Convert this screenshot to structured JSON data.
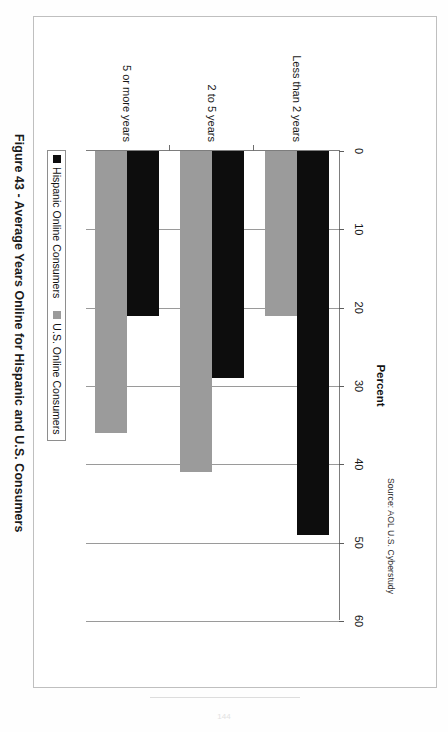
{
  "document": {
    "caption": "Figure 43 - Average Years Online for Hispanic and U.S. Consumers",
    "page_number": "144"
  },
  "chart_data": {
    "type": "bar",
    "orientation": "horizontal",
    "title": "",
    "xlabel": "Percent",
    "ylabel": "",
    "xlim": [
      0,
      60
    ],
    "xticks": [
      0,
      10,
      20,
      30,
      40,
      50,
      60
    ],
    "xtick_labels": [
      "0",
      "10",
      "20",
      "30",
      "40",
      "50",
      "60"
    ],
    "grid": true,
    "grid_axis": "x",
    "legend_position": "bottom-left",
    "categories": [
      "Less than 2 years",
      "2 to 5 years",
      "5 or more years"
    ],
    "series": [
      {
        "name": "Hispanic Online Consumers",
        "color": "#0d0d0d",
        "values": [
          49,
          29,
          21
        ]
      },
      {
        "name": "U.S. Online Consumers",
        "color": "#9b9b9b",
        "values": [
          21,
          41,
          36
        ]
      }
    ],
    "source": "Source: AOL U.S. Cyberstudy"
  }
}
